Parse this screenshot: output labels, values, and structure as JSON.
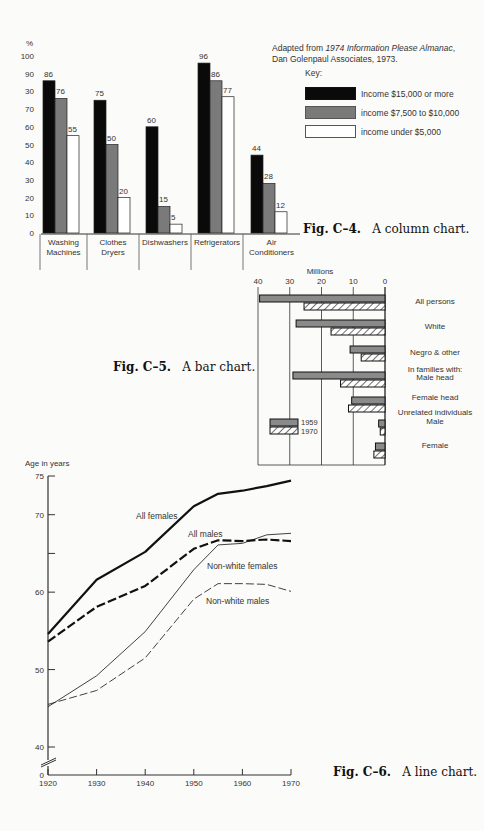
{
  "figures": {
    "c4": {
      "caption_num": "Fig. C–4.",
      "caption_text": "A column chart."
    },
    "c5": {
      "caption_num": "Fig. C–5.",
      "caption_text": "A bar chart."
    },
    "c6": {
      "caption_num": "Fig. C–6.",
      "caption_text": "A line chart."
    }
  },
  "source": {
    "prefix": "Adapted from ",
    "title": "1974 Information Please Almanac",
    "suffix": ",",
    "line2": "Dan Golenpaul Associates, 1973."
  },
  "key": {
    "title": "Key:",
    "items": [
      {
        "label": "Income $15,000 or more",
        "color": "#0a0a0a"
      },
      {
        "label": "income $7,500 to $10,000",
        "color": "#7a7a7a"
      },
      {
        "label": "income under $5,000",
        "color": "#ffffff"
      }
    ]
  },
  "chart_data": [
    {
      "type": "bar",
      "orientation": "vertical",
      "title": "",
      "ylabel": "%",
      "ylim": [
        0,
        100
      ],
      "yticks": [
        "0",
        "10",
        "20",
        "30",
        "40",
        "50",
        "60",
        "70",
        "30",
        "90",
        "100"
      ],
      "categories": [
        "Washing Machines",
        "Clothes Dryers",
        "Dishwashers",
        "Refrigerators",
        "Air Conditioners"
      ],
      "series": [
        {
          "name": "Income $15,000 or more",
          "values": [
            86,
            75,
            60,
            96,
            44
          ]
        },
        {
          "name": "income $7,500 to $10,000",
          "values": [
            76,
            50,
            15,
            86,
            28
          ]
        },
        {
          "name": "income under $5,000",
          "values": [
            55,
            20,
            5,
            77,
            12
          ]
        }
      ],
      "data_labels": true,
      "legend_position": "top-right"
    },
    {
      "type": "bar",
      "orientation": "horizontal",
      "title": "",
      "xlabel": "Millions",
      "xlim": [
        40,
        0
      ],
      "xticks": [
        "40",
        "30",
        "20",
        "10",
        "0"
      ],
      "grid": true,
      "categories": [
        "All persons",
        "White",
        "Negro & other",
        "In families with: Male head",
        "Female head",
        "Unrelated individuals Male",
        "Female"
      ],
      "series": [
        {
          "name": "1959",
          "pattern": "solid gray",
          "values": [
            39.5,
            28,
            11,
            29,
            10.5,
            2,
            3
          ]
        },
        {
          "name": "1970",
          "pattern": "hatched",
          "values": [
            25.5,
            17,
            7.5,
            14,
            11.5,
            1.5,
            3.5
          ]
        }
      ],
      "legend": [
        "1959",
        "1970"
      ]
    },
    {
      "type": "line",
      "title": "",
      "ylabel": "Age in years",
      "xlabel": "",
      "x": [
        1920,
        1930,
        1940,
        1950,
        1955,
        1960,
        1965,
        1970
      ],
      "xticks": [
        "1920",
        "1930",
        "1940",
        "1950",
        "1960",
        "1970"
      ],
      "yticks": [
        "0",
        "40",
        "50",
        "60",
        "70",
        "75"
      ],
      "ylim": [
        40,
        75
      ],
      "axis_break": true,
      "series": [
        {
          "name": "All females",
          "style": "thick solid",
          "values": [
            54.6,
            61.6,
            65.2,
            71.1,
            72.7,
            73.1,
            73.7,
            74.4
          ]
        },
        {
          "name": "All males",
          "style": "thick dashed",
          "values": [
            53.6,
            58.1,
            60.8,
            65.6,
            66.7,
            66.6,
            66.8,
            66.6
          ]
        },
        {
          "name": "Non-white females",
          "style": "thin solid",
          "values": [
            45.2,
            49.2,
            54.9,
            62.9,
            66.1,
            66.3,
            67.4,
            67.6
          ]
        },
        {
          "name": "Non-white males",
          "style": "thin dashed",
          "values": [
            45.5,
            47.3,
            51.5,
            59.1,
            61.1,
            61.1,
            61.0,
            60.1
          ]
        }
      ]
    }
  ],
  "column_chart": {
    "ylabel": "%",
    "yticks": [
      "0",
      "10",
      "20",
      "30",
      "40",
      "50",
      "60",
      "70",
      "30",
      "90",
      "100"
    ],
    "categories": [
      {
        "line1": "Washing",
        "line2": "Machines"
      },
      {
        "line1": "Clothes",
        "line2": "Dryers"
      },
      {
        "line1": "Dishwashers",
        "line2": ""
      },
      {
        "line1": "Refrigerators",
        "line2": ""
      },
      {
        "line1": "Air",
        "line2": "Conditioners"
      }
    ]
  },
  "bar_chart": {
    "xlabel": "Millions",
    "xticks": [
      "40",
      "30",
      "20",
      "10",
      "0"
    ],
    "labels": [
      {
        "line1": "All persons"
      },
      {
        "line1": "White"
      },
      {
        "line1": "Negro & other"
      },
      {
        "line1": "In families with:",
        "line2": "Male head"
      },
      {
        "line1": "Female head"
      },
      {
        "line1": "Unrelated individuals",
        "line2": "Male"
      },
      {
        "line1": "Female"
      }
    ],
    "legend": [
      "1959",
      "1970"
    ]
  },
  "line_chart": {
    "ylabel": "Age in years",
    "labels": [
      "All females",
      "All males",
      "Non-white females",
      "Non-white males"
    ]
  }
}
